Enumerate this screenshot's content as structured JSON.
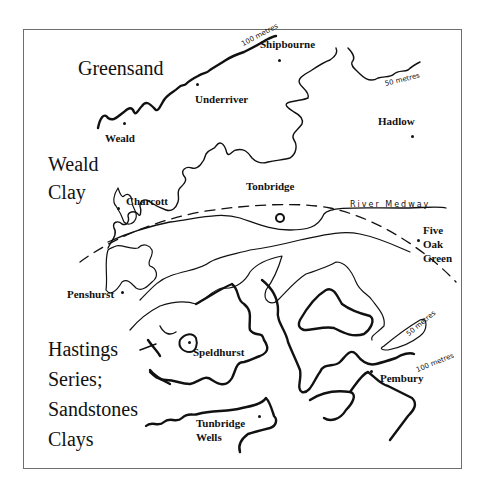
{
  "map": {
    "regions": {
      "greensand": "Greensand",
      "weald_clay_1": "Weald",
      "weald_clay_2": "Clay",
      "hastings_1": "Hastings",
      "hastings_2": "Series;",
      "hastings_3": "Sandstones",
      "hastings_4": "Clays"
    },
    "places": {
      "shipbourne": "Shipbourne",
      "underriver": "Underriver",
      "weald": "Weald",
      "hadlow": "Hadlow",
      "charcott": "Charcott",
      "tonbridge": "Tonbridge",
      "five": "Five",
      "oak": "Oak",
      "green": "Green",
      "penshurst": "Penshurst",
      "speldhurst": "Speldhurst",
      "pembury": "Pembury",
      "tunbridge": "Tunbridge",
      "wells": "Wells"
    },
    "contour_labels": {
      "top_100": "100 metres",
      "top_50": "50 metres",
      "right_50": "50 metres",
      "right_100": "100 metres"
    },
    "river": "River Medway",
    "colors": {
      "ink": "#111111",
      "frame": "#6e6e6e",
      "background": "#ffffff"
    }
  }
}
